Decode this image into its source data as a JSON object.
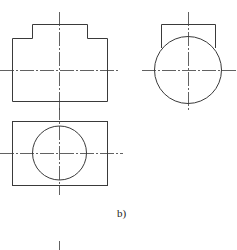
{
  "figure": {
    "label": "b)",
    "views": [
      {
        "name": "front-view",
        "description": "stepped rectangle outline with center lines"
      },
      {
        "name": "side-view",
        "description": "circle with rectangular top portion and center lines"
      },
      {
        "name": "top-view",
        "description": "rectangle with inscribed circle and center lines"
      }
    ]
  },
  "colors": {
    "line": "#3a3a3a",
    "background": "#ffffff"
  }
}
